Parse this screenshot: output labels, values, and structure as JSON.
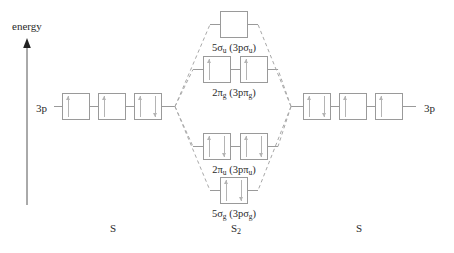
{
  "diagram": {
    "title_axis": "energy",
    "species": [
      {
        "name": "species-left",
        "label": "S",
        "sub": "",
        "x": 113
      },
      {
        "name": "species-mo",
        "label": "S",
        "sub": "2",
        "x": 236
      },
      {
        "name": "species-right",
        "label": "S",
        "sub": "",
        "x": 359
      }
    ],
    "atomic_labels": [
      {
        "name": "atomic-label-left",
        "text": "3p",
        "x": 36,
        "y": 102
      },
      {
        "name": "atomic-label-right",
        "text": "3p",
        "x": 424,
        "y": 102
      }
    ],
    "atomic_orbitals_left": [
      {
        "name": "ao-left-1",
        "x": 62,
        "y": 93,
        "w": 28,
        "h": 27,
        "electrons": [
          "up"
        ]
      },
      {
        "name": "ao-left-2",
        "x": 98,
        "y": 93,
        "w": 28,
        "h": 27,
        "electrons": [
          "up"
        ]
      },
      {
        "name": "ao-left-3",
        "x": 134,
        "y": 93,
        "w": 28,
        "h": 27,
        "electrons": [
          "up",
          "down"
        ]
      }
    ],
    "atomic_orbitals_right": [
      {
        "name": "ao-right-1",
        "x": 303,
        "y": 93,
        "w": 28,
        "h": 27,
        "electrons": [
          "up",
          "down"
        ]
      },
      {
        "name": "ao-right-2",
        "x": 339,
        "y": 93,
        "w": 28,
        "h": 27,
        "electrons": [
          "up"
        ]
      },
      {
        "name": "ao-right-3",
        "x": 375,
        "y": 93,
        "w": 28,
        "h": 27,
        "electrons": [
          "up"
        ]
      }
    ],
    "molecular_orbitals": [
      {
        "name": "mo-5sigma-u",
        "level": "antibonding-sigma",
        "boxes": [
          {
            "x": 220,
            "y": 11,
            "w": 28,
            "h": 27,
            "electrons": []
          }
        ],
        "label": {
          "text": "5σ",
          "sub1": "u",
          "mid": " (3pσ",
          "sub2": "u",
          "end": ")",
          "x": 234,
          "y": 43
        }
      },
      {
        "name": "mo-2pi-g",
        "level": "antibonding-pi",
        "boxes": [
          {
            "x": 203,
            "y": 56,
            "w": 28,
            "h": 27,
            "electrons": [
              "up"
            ]
          },
          {
            "x": 240,
            "y": 56,
            "w": 28,
            "h": 27,
            "electrons": [
              "up"
            ]
          }
        ],
        "label": {
          "text": "2π",
          "sub1": "g",
          "mid": " (3pπ",
          "sub2": "g",
          "end": ")",
          "x": 234,
          "y": 88
        }
      },
      {
        "name": "mo-2pi-u",
        "level": "bonding-pi",
        "boxes": [
          {
            "x": 203,
            "y": 133,
            "w": 28,
            "h": 27,
            "electrons": [
              "up",
              "down"
            ]
          },
          {
            "x": 240,
            "y": 133,
            "w": 28,
            "h": 27,
            "electrons": [
              "up",
              "down"
            ]
          }
        ],
        "label": {
          "text": "2π",
          "sub1": "u",
          "mid": " (3pπ",
          "sub2": "u",
          "end": ")",
          "x": 234,
          "y": 165
        }
      },
      {
        "name": "mo-5sigma-g",
        "level": "bonding-sigma",
        "boxes": [
          {
            "x": 220,
            "y": 177,
            "w": 28,
            "h": 27,
            "electrons": [
              "up",
              "down"
            ]
          }
        ],
        "label": {
          "text": "5σ",
          "sub1": "g",
          "mid": " (3pσ",
          "sub2": "g",
          "end": ")",
          "x": 234,
          "y": 209
        }
      }
    ],
    "colors": {
      "box_stroke": "#9a9a9a",
      "arrow": "#b4b4b4",
      "connector": "#9a9a9a",
      "dashed": "#a8a8a8",
      "axis": "#555555",
      "text": "#2a2a2a"
    }
  }
}
